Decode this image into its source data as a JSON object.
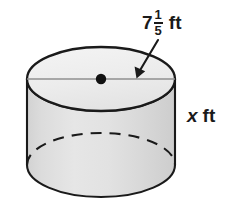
{
  "figure": {
    "type": "geometry-diagram",
    "shape": "cylinder",
    "background_color": "#ffffff",
    "stroke_color": "#1a1a1a",
    "top_face_fill": "#efefef",
    "body_fill": "#dedede",
    "labels": {
      "diameter": {
        "whole": "7",
        "numerator": "1",
        "denominator": "5",
        "unit": "ft",
        "full_text": "7 1/5 ft",
        "points_to": "diameter-line"
      },
      "height": {
        "variable": "x",
        "unit": "ft",
        "full_text": "x ft"
      }
    },
    "elements": {
      "top_ellipse": "top-face-ellipse",
      "diameter_line": "diameter-line",
      "center_point": "center-dot",
      "body": "cylinder-body",
      "hidden_bottom_arc": "dashed-bottom-back-arc",
      "arrow": "diameter-arrow"
    }
  }
}
